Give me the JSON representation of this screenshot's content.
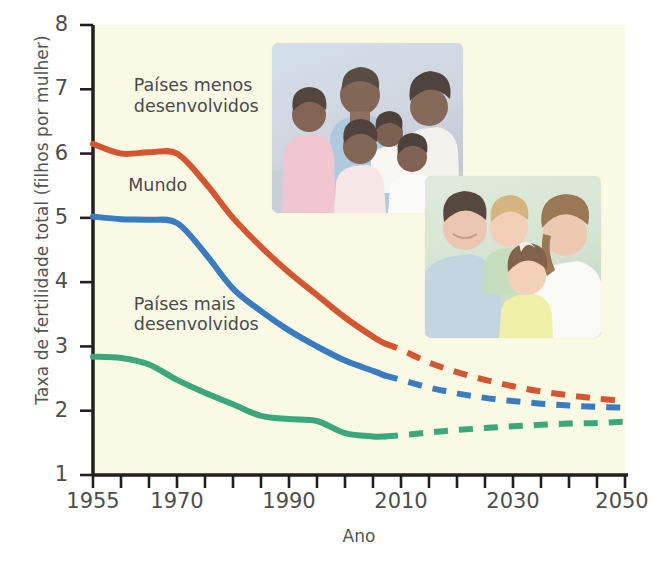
{
  "chart_data": {
    "type": "line",
    "title": "",
    "xlabel": "Ano",
    "ylabel": "Taxa de fertilidade total (filhos por mulher)",
    "xlim": [
      1955,
      2050
    ],
    "ylim": [
      1,
      8
    ],
    "ytick_labels": [
      "8",
      "7",
      "6",
      "5",
      "4",
      "3",
      "2",
      "1"
    ],
    "ytick_values": [
      8,
      7,
      6,
      5,
      4,
      3,
      2,
      1
    ],
    "xtick_labels": [
      "1955",
      "1970",
      "1990",
      "2010",
      "2030",
      "2050"
    ],
    "xtick_values": [
      1955,
      1970,
      1990,
      2010,
      2030,
      2050
    ],
    "minor_tick_step": 5,
    "grid": false,
    "legend_position": "inline-annotations",
    "projection_start_year": 2007,
    "series": [
      {
        "name": "Países menos desenvolvidos",
        "color": "#d4552f",
        "x": [
          1955,
          1960,
          1965,
          1970,
          1975,
          1980,
          1985,
          1990,
          1995,
          2000,
          2005,
          2007,
          2010,
          2015,
          2020,
          2025,
          2030,
          2035,
          2040,
          2045,
          2050
        ],
        "values": [
          6.15,
          6.0,
          6.02,
          6.0,
          5.55,
          5.0,
          4.55,
          4.15,
          3.8,
          3.45,
          3.15,
          3.05,
          2.95,
          2.75,
          2.6,
          2.48,
          2.38,
          2.3,
          2.24,
          2.19,
          2.15
        ]
      },
      {
        "name": "Mundo",
        "color": "#3a7cc0",
        "x": [
          1955,
          1960,
          1965,
          1970,
          1975,
          1980,
          1985,
          1990,
          1995,
          2000,
          2005,
          2007,
          2010,
          2015,
          2020,
          2025,
          2030,
          2035,
          2040,
          2045,
          2050
        ],
        "values": [
          5.02,
          4.98,
          4.97,
          4.92,
          4.45,
          3.9,
          3.55,
          3.25,
          3.0,
          2.78,
          2.62,
          2.55,
          2.48,
          2.36,
          2.27,
          2.2,
          2.15,
          2.11,
          2.08,
          2.06,
          2.05
        ]
      },
      {
        "name": "Países mais desenvolvidos",
        "color": "#3aa87a",
        "x": [
          1955,
          1960,
          1965,
          1970,
          1975,
          1980,
          1985,
          1990,
          1995,
          2000,
          2005,
          2007,
          2010,
          2015,
          2020,
          2025,
          2030,
          2035,
          2040,
          2045,
          2050
        ],
        "values": [
          2.84,
          2.82,
          2.72,
          2.48,
          2.28,
          2.1,
          1.92,
          1.87,
          1.84,
          1.65,
          1.6,
          1.6,
          1.62,
          1.66,
          1.7,
          1.73,
          1.76,
          1.78,
          1.8,
          1.81,
          1.83
        ]
      }
    ],
    "annotations": [
      {
        "id": "least_developed",
        "text": "Países menos\ndesenvolvidos",
        "series": "Países menos desenvolvidos"
      },
      {
        "id": "world",
        "text": "Mundo",
        "series": "Mundo"
      },
      {
        "id": "most_developed",
        "text": "Países mais\ndesenvolvidos",
        "series": "Países mais desenvolvidos"
      }
    ],
    "plot_background": "#f9f9e4",
    "axis_color": "#231f20"
  },
  "photos": [
    {
      "id": "developing-family",
      "caption": "",
      "people": 6,
      "background": "#c3d3e1"
    },
    {
      "id": "developed-family",
      "caption": "",
      "people": 4,
      "background": "#cfe0cc"
    }
  ]
}
